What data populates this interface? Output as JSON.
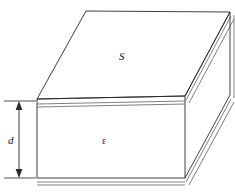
{
  "figure": {
    "labels": {
      "top_face": "S",
      "front_face": "ε",
      "thickness": "d"
    },
    "icons": {
      "arrow_up": "arrow-up-icon",
      "arrow_down": "arrow-down-icon"
    },
    "colors": {
      "stroke": "#2a2a2a",
      "stroke_light": "#4a4a4a",
      "face": "#ffffff",
      "background": "#ffffff"
    },
    "geometry": {
      "top_face_points": "86,11 230,12 185,96 37,99",
      "front_face_points": "37,99 185,96 185,178 37,178",
      "right_face_points": "185,96 230,12 230,95 185,178",
      "top_slab_band_points": "37,99 185,96 185,103 37,106",
      "bottom_slab_band_points": "37,178 185,178 185,185 37,185",
      "right_slab_band_points": "185,96 230,12 234,15 189,99",
      "right_bottom_band_points": "185,178 230,95 234,98 189,181",
      "dimension_x": 19,
      "dimension_top_y": 101,
      "dimension_bottom_y": 178,
      "tick_left_x": 4,
      "tick_right_x": 36
    }
  }
}
